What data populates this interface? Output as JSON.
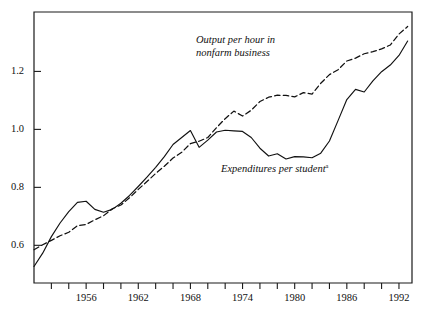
{
  "chart_data": {
    "type": "line",
    "title": "",
    "subtitle": "",
    "xlabel": "",
    "ylabel": "",
    "xlim": [
      1950,
      1993.5
    ],
    "ylim": [
      0.47,
      1.405
    ],
    "grid": false,
    "legend_position": "inline-annotations",
    "x_tick_labels": [
      "1956",
      "1962",
      "1968",
      "1974",
      "1980",
      "1986",
      "1992"
    ],
    "x_tick_values": [
      1956,
      1962,
      1968,
      1974,
      1980,
      1986,
      1992
    ],
    "x_minor_tick_values": [
      1952,
      1954,
      1956,
      1958,
      1960,
      1962,
      1964,
      1966,
      1968,
      1970,
      1972,
      1974,
      1976,
      1978,
      1980,
      1982,
      1984,
      1986,
      1988,
      1990,
      1992
    ],
    "y_tick_labels": [
      "0.6",
      "0.8",
      "1.0",
      "1.2"
    ],
    "y_tick_values": [
      0.6,
      0.8,
      1.0,
      1.2
    ],
    "series": [
      {
        "name": "Output per hour in nonfarm business",
        "style": "dashed",
        "color": "#111111",
        "annotation_line1": "Output per hour in",
        "annotation_line2": "nonfarm business",
        "x": [
          1950,
          1951,
          1952,
          1953,
          1954,
          1955,
          1956,
          1957,
          1958,
          1959,
          1960,
          1961,
          1962,
          1963,
          1964,
          1965,
          1966,
          1967,
          1968,
          1969,
          1970,
          1971,
          1972,
          1973,
          1974,
          1975,
          1976,
          1977,
          1978,
          1979,
          1980,
          1981,
          1982,
          1983,
          1984,
          1985,
          1986,
          1987,
          1988,
          1989,
          1990,
          1991,
          1992,
          1993
        ],
        "values": [
          0.585,
          0.602,
          0.617,
          0.633,
          0.645,
          0.668,
          0.672,
          0.688,
          0.702,
          0.726,
          0.739,
          0.764,
          0.793,
          0.82,
          0.848,
          0.873,
          0.901,
          0.921,
          0.951,
          0.959,
          0.972,
          1.006,
          1.037,
          1.063,
          1.046,
          1.066,
          1.096,
          1.111,
          1.118,
          1.117,
          1.112,
          1.127,
          1.122,
          1.159,
          1.189,
          1.206,
          1.236,
          1.246,
          1.261,
          1.268,
          1.278,
          1.291,
          1.329,
          1.355
        ]
      },
      {
        "name": "Expenditures per student",
        "style": "solid",
        "color": "#111111",
        "annotation": "Expenditures per student",
        "annotation_superscript": "a",
        "x": [
          1950,
          1951,
          1952,
          1953,
          1954,
          1955,
          1956,
          1957,
          1958,
          1959,
          1960,
          1961,
          1962,
          1963,
          1964,
          1965,
          1966,
          1967,
          1968,
          1969,
          1970,
          1971,
          1972,
          1973,
          1974,
          1975,
          1976,
          1977,
          1978,
          1979,
          1980,
          1981,
          1982,
          1983,
          1984,
          1985,
          1986,
          1987,
          1988,
          1989,
          1990,
          1991,
          1992,
          1993
        ],
        "values": [
          0.527,
          0.573,
          0.63,
          0.677,
          0.716,
          0.748,
          0.752,
          0.724,
          0.714,
          0.724,
          0.745,
          0.772,
          0.803,
          0.835,
          0.869,
          0.906,
          0.948,
          0.972,
          0.996,
          0.938,
          0.963,
          0.991,
          0.997,
          0.995,
          0.993,
          0.972,
          0.935,
          0.908,
          0.916,
          0.898,
          0.906,
          0.905,
          0.902,
          0.918,
          0.96,
          1.031,
          1.103,
          1.138,
          1.129,
          1.167,
          1.199,
          1.222,
          1.255,
          1.305
        ]
      }
    ]
  },
  "plot_geometry": {
    "left": 34,
    "right": 412,
    "top": 12,
    "bottom": 283
  }
}
